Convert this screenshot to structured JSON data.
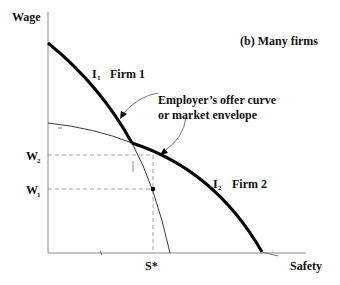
{
  "diagram": {
    "title": "(b) Many firms",
    "y_axis_label": "Wage",
    "x_axis_label": "Safety",
    "curves": [
      {
        "name": "I",
        "subscript": "1",
        "label": "Firm 1"
      },
      {
        "name": "I",
        "subscript": "2",
        "label": "Firm 2"
      }
    ],
    "annotation": {
      "line1": "Employer’s offer curve",
      "line2": "or market envelope"
    },
    "y_ticks": [
      {
        "name": "W",
        "subscript": "2"
      },
      {
        "name": "W",
        "subscript": "1"
      }
    ],
    "x_ticks": [
      {
        "label": "S*"
      }
    ],
    "colors": {
      "curve": "#000000",
      "axis": "#8a8a8a",
      "dashed": "#9a9a9a"
    }
  }
}
